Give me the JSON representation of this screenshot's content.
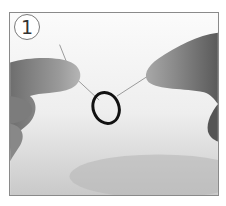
{
  "figure": {
    "step_number": "1",
    "colors": {
      "frame_border": "#8a8a8a",
      "background": "#f4f4f4",
      "skin": "#8c8c8c",
      "ring": "#111111",
      "wire": "#9a9a9a"
    }
  }
}
